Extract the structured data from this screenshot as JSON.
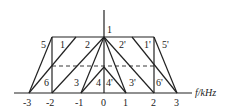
{
  "diagram": {
    "axis_label": "f/kHz",
    "ticks": [
      "-3",
      "-2",
      "-1",
      "0",
      "1",
      "2",
      "3"
    ],
    "region_labels": {
      "apex": "1",
      "left": [
        "5",
        "1",
        "2",
        "6",
        "3",
        "4"
      ],
      "right": [
        "2'",
        "1'",
        "5'",
        "4'",
        "3'",
        "6'"
      ]
    }
  }
}
